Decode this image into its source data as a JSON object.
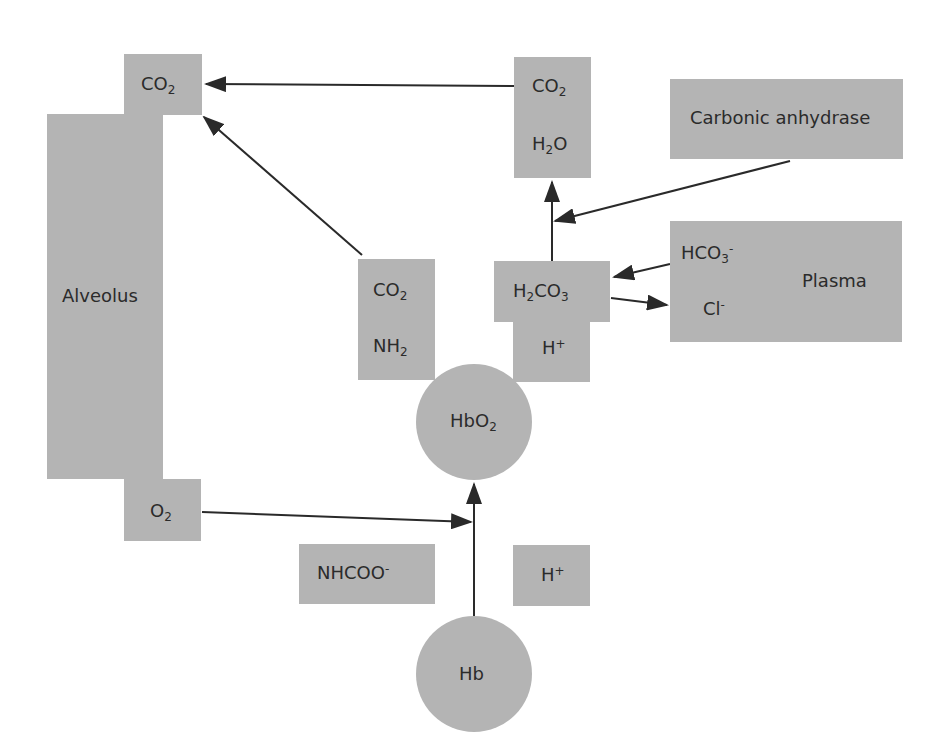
{
  "diagram": {
    "title": "",
    "colors": {
      "node_fill": "#b4b4b4",
      "arrow": "#2a2a2a",
      "text": "#2b2b2b",
      "background": "#ffffff"
    },
    "nodes": {
      "alveolus": {
        "label": "Alveolus"
      },
      "alveolus_co2": {
        "base": "CO",
        "sub": "2"
      },
      "alveolus_o2": {
        "base": "O",
        "sub": "2"
      },
      "co2_h2o": {
        "line1": {
          "base": "CO",
          "sub": "2"
        },
        "line2": {
          "a": "H",
          "sub": "2",
          "b": "O"
        }
      },
      "carbonic_anhydrase": {
        "label": "Carbonic anhydrase"
      },
      "carbamino": {
        "line1": {
          "base": "CO",
          "sub": "2"
        },
        "line2": {
          "base": "NH",
          "sub": "2"
        }
      },
      "h2co3": {
        "a": "H",
        "sub1": "2",
        "b": "CO",
        "sub2": "3"
      },
      "h_plus_upper": {
        "base": "H",
        "sup": "+"
      },
      "plasma": {
        "label": "Plasma",
        "bicarbonate": {
          "base": "HCO",
          "sub": "3",
          "sup": "-"
        },
        "chloride": {
          "base": "Cl",
          "sup": "-"
        }
      },
      "hbo2": {
        "base": "HbO",
        "sub": "2"
      },
      "nhcoo": {
        "base": "NHCOO",
        "sup": "-"
      },
      "h_plus_lower": {
        "base": "H",
        "sup": "+"
      },
      "hb": {
        "label": "Hb"
      }
    },
    "edges": [
      {
        "from": "co2_h2o",
        "to": "alveolus_co2"
      },
      {
        "from": "carbamino",
        "to": "alveolus_co2"
      },
      {
        "from": "h2co3",
        "to": "co2_h2o"
      },
      {
        "from": "carbonic_anhydrase",
        "to": "h2co3-co2_h2o edge"
      },
      {
        "from": "plasma.bicarbonate",
        "to": "h2co3"
      },
      {
        "from": "h2co3",
        "to": "plasma.chloride"
      },
      {
        "from": "alveolus_o2",
        "to": "hb-hbo2 edge"
      },
      {
        "from": "hb",
        "to": "hbo2"
      }
    ]
  }
}
